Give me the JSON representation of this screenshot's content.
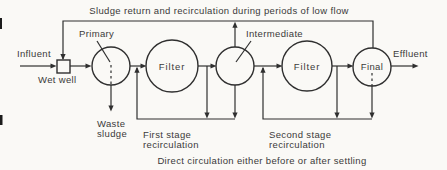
{
  "colors": {
    "background": "#faf9f6",
    "line": "#2f2f2f",
    "text": "#3a3a3a"
  },
  "captions": {
    "top": "Sludge return and recirculation during periods of low flow",
    "bottom": "Direct circulation either before or after settling"
  },
  "nodes": {
    "wet_well": "Wet well",
    "primary_clarifier": "Primary",
    "first_filter": "Filter",
    "intermediate_clarifier": "Intermediate",
    "second_filter": "Filter",
    "final_clarifier": "Final"
  },
  "streams": {
    "influent": "Influent",
    "effluent": "Effluent",
    "waste_sludge": [
      "Waste",
      "sludge"
    ],
    "first_stage": [
      "First stage",
      "recirculation"
    ],
    "second_stage": [
      "Second stage",
      "recirculation"
    ]
  }
}
